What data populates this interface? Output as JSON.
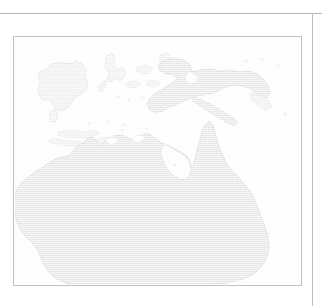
{
  "figure": {
    "kind": "map-figure",
    "region_title": "",
    "caption": "",
    "labels": [],
    "has_visible_text": false
  },
  "page_rules": {
    "top_rule": {
      "name": "page-top-rule",
      "color": "#b6b6b6",
      "y": 13
    },
    "right_rule": {
      "name": "page-right-rule",
      "color": "#bcbcbc",
      "x": 312
    }
  },
  "map": {
    "frame": {
      "border_color": "#c2c2c2",
      "background_color": "#fdfdfd",
      "x": 13,
      "y": 36,
      "width": 289,
      "height": 250
    },
    "style": {
      "ocean_color": "#fdfdfd",
      "land_fill": "#e3e3e3",
      "land_fill_light": "#ececec",
      "coastline_color": "#c9c9c9",
      "island_fill": "#eeeeee",
      "island_outline": "#d2d2d2",
      "texture": "halftone-dither",
      "washed_out": true
    },
    "projection_note": "equirectangular, northern Australia / New Guinea / eastern Indonesia",
    "landmasses": [
      {
        "name": "australia",
        "label": "",
        "kind": "continent"
      },
      {
        "name": "new-guinea",
        "label": "",
        "kind": "island"
      },
      {
        "name": "borneo",
        "label": "",
        "kind": "island"
      },
      {
        "name": "sulawesi",
        "label": "",
        "kind": "island"
      },
      {
        "name": "java",
        "label": "",
        "kind": "island"
      },
      {
        "name": "lesser-sunda-islands",
        "label": "",
        "kind": "island-chain"
      },
      {
        "name": "seram-buru",
        "label": "",
        "kind": "island-chain"
      },
      {
        "name": "new-britain",
        "label": "",
        "kind": "island"
      },
      {
        "name": "tasman-small-islands",
        "label": "",
        "kind": "island-chain"
      }
    ],
    "features": [
      {
        "name": "cape-york-peninsula",
        "label": ""
      },
      {
        "name": "gulf-of-carpentaria",
        "label": ""
      },
      {
        "name": "arnhem-land",
        "label": ""
      },
      {
        "name": "great-australian-bight",
        "label": ""
      },
      {
        "name": "torres-strait",
        "label": ""
      }
    ]
  }
}
